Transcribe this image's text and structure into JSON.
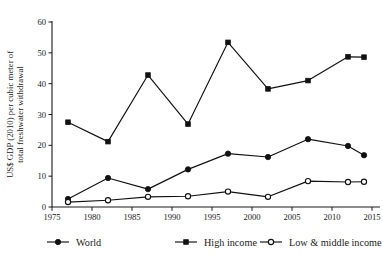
{
  "chart_data": {
    "type": "line",
    "title": "",
    "subtitle": "",
    "xlabel": "",
    "ylabel": "US$ GDP (2010) per cubic meter of total freshwater withdrawal",
    "xlim": [
      1975,
      2015
    ],
    "ylim": [
      0,
      60
    ],
    "xticks": [
      1975,
      1980,
      1985,
      1990,
      1995,
      2000,
      2005,
      2010,
      2015
    ],
    "yticks": [
      0,
      10,
      20,
      30,
      40,
      50,
      60
    ],
    "xtick_labels": [
      "1975",
      "1980",
      "1985",
      "1990",
      "1995",
      "2000",
      "2005",
      "2010",
      "2015"
    ],
    "ytick_labels": [
      "0",
      "10",
      "20",
      "30",
      "40",
      "50",
      "60"
    ],
    "grid": false,
    "legend_position": "bottom",
    "x": [
      1977,
      1982,
      1987,
      1992,
      1997,
      2002,
      2007,
      2012,
      2014
    ],
    "series": [
      {
        "name": "World",
        "marker": "filled-circle",
        "values": [
          2.6,
          9.4,
          5.8,
          12.2,
          17.3,
          16.2,
          22.0,
          19.8,
          16.8
        ]
      },
      {
        "name": "High income",
        "marker": "filled-square",
        "values": [
          27.5,
          21.2,
          42.8,
          26.9,
          53.4,
          38.3,
          41.0,
          48.7,
          48.6
        ]
      },
      {
        "name": "Low & middle income",
        "marker": "open-circle",
        "values": [
          1.6,
          2.2,
          3.3,
          3.5,
          5.0,
          3.3,
          8.4,
          8.1,
          8.2
        ]
      }
    ]
  },
  "legend": {
    "entries": [
      {
        "label": "World",
        "marker": "filled-circle"
      },
      {
        "label": "High income",
        "marker": "filled-square"
      },
      {
        "label": "Low & middle income",
        "marker": "open-circle"
      }
    ]
  },
  "colors": {
    "ink": "#111111",
    "background": "#ffffff"
  }
}
